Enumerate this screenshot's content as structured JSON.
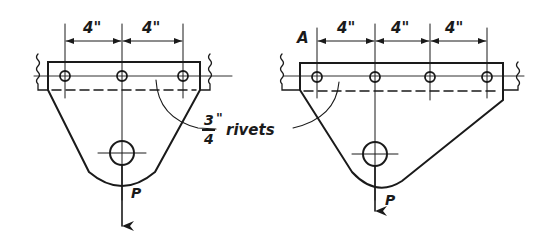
{
  "figures": {
    "left": {
      "dimensions": [
        "4\"",
        "4\""
      ],
      "load_label": "P",
      "rivet_count": 3
    },
    "right": {
      "corner_label": "A",
      "dimensions": [
        "4\"",
        "4\"",
        "4\""
      ],
      "load_label": "P",
      "rivet_count": 4
    }
  },
  "callout": {
    "fraction_numerator": "3",
    "fraction_denominator": "4",
    "inch_mark": "\"",
    "text": "rivets"
  },
  "colors": {
    "ink": "#1a1a1a",
    "background": "#ffffff"
  }
}
